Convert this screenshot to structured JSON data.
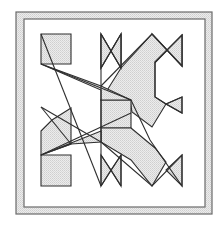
{
  "figure": {
    "colors": {
      "background": "#ffffff",
      "frame_band": "#e4e4e4",
      "frame_stroke": "#6a6a6a",
      "shape_fill": "#e2e2e2",
      "shape_stroke": "#2e2e2e"
    },
    "frame": {
      "outer": {
        "x": 16,
        "y": 12,
        "w": 196,
        "h": 202
      },
      "inner": {
        "x": 24,
        "y": 19,
        "w": 181,
        "h": 188
      }
    },
    "polygon_points": "41,34 71,34 71,64 41,64 152,104 152,107 128,107 128,151 101,151 101,128 61,123 41,163 41,131 52,119 71,108 71,143 96,145 61,88 41,107 41,77 71,119 101,160 101,186 72,186 72,154 101,154 125,170 146,171 131,141 110,117 101,117 101,151 41,148 41,123 71,123 71,100 101,100 101,100 101,34 121,53 101,68 101,34 121,34 121,100 153,136 166,150 144,172 121,170 88,125 62,99 41,76 152,33 174,49 182,37 182,66 166,56 155,61 155,96 166,103 182,97 182,126 166,117 152,136 121,172 121,143 141,156 162,171 182,155 182,186 161,170 140,184 121,186 121,135 96,112 41,135 41,186 71,186 71,160 41,160"
  }
}
